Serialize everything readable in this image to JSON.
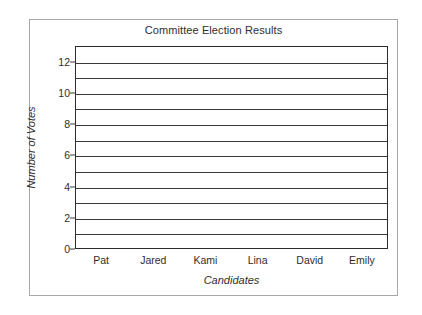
{
  "chart_data": {
    "type": "bar",
    "title": "Committee Election Results",
    "xlabel": "Candidates",
    "ylabel": "Number of Votes",
    "categories": [
      "Pat",
      "Jared",
      "Kami",
      "Lina",
      "David",
      "Emily"
    ],
    "values": [
      null,
      null,
      null,
      null,
      null,
      null
    ],
    "series": [
      {
        "name": "Number of Votes",
        "values": [
          null,
          null,
          null,
          null,
          null,
          null
        ]
      }
    ],
    "ylim": [
      0,
      13
    ],
    "ytick_values": [
      0,
      2,
      4,
      6,
      8,
      10,
      12
    ],
    "ytick_labels": [
      "0",
      "2",
      "4",
      "6",
      "8",
      "10",
      "12"
    ],
    "ytick_minor_step": 1,
    "gridline_values": [
      1,
      2,
      3,
      4,
      5,
      6,
      7,
      8,
      9,
      10,
      11,
      12
    ],
    "grid": "horizontal",
    "legend": null,
    "legend_position": "none",
    "annotations": [],
    "note": "blank grid template - no bars plotted",
    "colors": {
      "figure_background": "#ffffff",
      "figure_border": "#a8a8a8",
      "plot_border": "#2b2b2b",
      "gridline": "#3a3a3a",
      "text": "#2e2e2e"
    }
  }
}
